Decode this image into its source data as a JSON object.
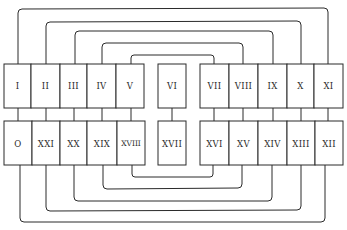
{
  "diagram": {
    "title": "",
    "colors": {
      "stroke": "#2a2a2a",
      "background": "#ffffff"
    },
    "top_row": [
      {
        "id": "I",
        "label": "I"
      },
      {
        "id": "II",
        "label": "II"
      },
      {
        "id": "III",
        "label": "III"
      },
      {
        "id": "IV",
        "label": "IV"
      },
      {
        "id": "V",
        "label": "V"
      },
      {
        "id": "VI",
        "label": "VI"
      },
      {
        "id": "VII",
        "label": "VII"
      },
      {
        "id": "VIII",
        "label": "VIII"
      },
      {
        "id": "IX",
        "label": "IX"
      },
      {
        "id": "X",
        "label": "X"
      },
      {
        "id": "XI",
        "label": "XI"
      }
    ],
    "bottom_row": [
      {
        "id": "0",
        "label": "O"
      },
      {
        "id": "XXI",
        "label": "XXI"
      },
      {
        "id": "XX",
        "label": "XX"
      },
      {
        "id": "XIX",
        "label": "XIX"
      },
      {
        "id": "XVIII",
        "label": "XVIII"
      },
      {
        "id": "XVII",
        "label": "XVII"
      },
      {
        "id": "XVI",
        "label": "XVI"
      },
      {
        "id": "XV",
        "label": "XV"
      },
      {
        "id": "XIV",
        "label": "XIV"
      },
      {
        "id": "XIII",
        "label": "XIII"
      },
      {
        "id": "XII",
        "label": "XII"
      }
    ],
    "top_connections": [
      [
        "I",
        "XI"
      ],
      [
        "II",
        "X"
      ],
      [
        "III",
        "IX"
      ],
      [
        "IV",
        "VIII"
      ],
      [
        "V",
        "VII"
      ]
    ],
    "vertical_connections": [
      [
        "I",
        "0"
      ],
      [
        "II",
        "XXI"
      ],
      [
        "III",
        "XX"
      ],
      [
        "IV",
        "XIX"
      ],
      [
        "V",
        "XVIII"
      ],
      [
        "VI",
        "XVII"
      ],
      [
        "VII",
        "XVI"
      ],
      [
        "VIII",
        "XV"
      ],
      [
        "IX",
        "XIV"
      ],
      [
        "X",
        "XIII"
      ],
      [
        "XI",
        "XII"
      ]
    ],
    "bottom_connections": [
      [
        "XVIII",
        "XVI"
      ],
      [
        "XIX",
        "XV"
      ],
      [
        "XX",
        "XIV"
      ],
      [
        "XXI",
        "XIII"
      ],
      [
        "0",
        "XII"
      ]
    ]
  }
}
